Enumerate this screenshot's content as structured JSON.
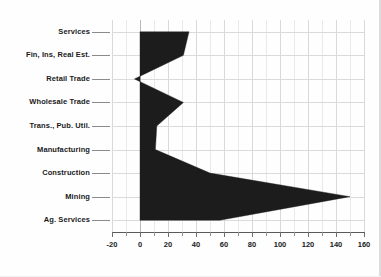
{
  "chart_data": {
    "type": "area",
    "orientation": "horizontal",
    "title": "",
    "subtitle": "",
    "xlabel": "",
    "ylabel": "",
    "xlim": [
      -20,
      160
    ],
    "xticks": [
      -20,
      0,
      20,
      40,
      60,
      80,
      100,
      120,
      140,
      160
    ],
    "xticklabels": [
      "-20",
      "0",
      "20",
      "40",
      "60",
      "80",
      "100",
      "120",
      "140",
      "160"
    ],
    "minor_tick_step": 10,
    "grid": true,
    "legend": false,
    "legend_position": "none",
    "baseline": 0,
    "fill_color": "#1c1c1c",
    "categories": [
      "Services",
      "Fin, Ins, Real Est.",
      "Retail Trade",
      "Wholesale Trade",
      "Trans., Pub. Util.",
      "Manufacturing",
      "Construction",
      "Mining",
      "Ag. Services"
    ],
    "values": [
      35,
      31,
      -4,
      31,
      12,
      11,
      50,
      150,
      57
    ]
  },
  "axis": {
    "x_tick_labels": [
      "-20",
      "0",
      "20",
      "40",
      "60",
      "80",
      "100",
      "120",
      "140",
      "160"
    ],
    "category_labels": [
      "Services",
      "Fin, Ins, Real Est.",
      "Retail Trade",
      "Wholesale Trade",
      "Trans., Pub. Util.",
      "Manufacturing",
      "Construction",
      "Mining",
      "Ag. Services"
    ]
  },
  "colors": {
    "series_fill": "#1c1c1c",
    "grid": "#d9d9d9",
    "axis": "#5a5a5a",
    "text": "#1a1a1a",
    "background": "#ffffff"
  }
}
